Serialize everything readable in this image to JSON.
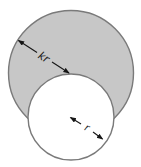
{
  "figure": {
    "background": "#ffffff",
    "annotation_color": "#161616",
    "large_circle": {
      "label": "kr",
      "fill": "#c7c7c7",
      "stroke": "#7a7a7a"
    },
    "small_circle": {
      "label": "r",
      "fill": "#ffffff",
      "stroke": "#7a7a7a"
    }
  }
}
